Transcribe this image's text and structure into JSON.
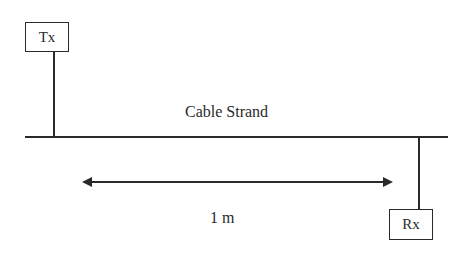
{
  "diagram": {
    "transmitter": {
      "label": "Tx"
    },
    "receiver": {
      "label": "Rx"
    },
    "cable": {
      "label": "Cable Strand"
    },
    "distance": {
      "label": "1 m"
    }
  }
}
